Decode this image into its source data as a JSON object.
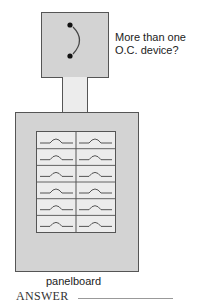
{
  "diagram": {
    "question_label_line1": "More than one",
    "question_label_line2": "O.C. device?",
    "panel_label": "panelboard",
    "answer_label": "ANSWER",
    "breaker_rows": 6,
    "breaker_columns": 2,
    "colors": {
      "box_fill": "#d3d3d3",
      "conduit_fill": "#ececec",
      "grid_fill": "#ececec",
      "outline": "#555555"
    }
  }
}
